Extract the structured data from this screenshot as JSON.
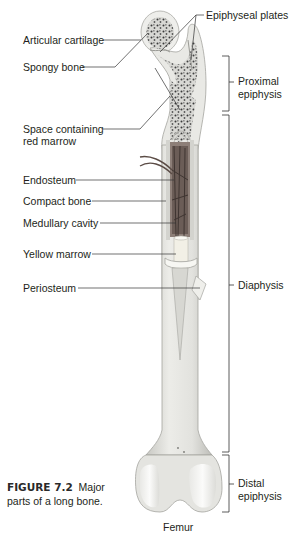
{
  "diagram": {
    "title": "Femur",
    "caption": {
      "figure_number": "FIGURE 7.2",
      "text_line1": "Major",
      "text_line2": "parts of a long bone."
    },
    "left_labels": [
      {
        "id": "articular-cartilage",
        "text": "Articular cartilage"
      },
      {
        "id": "spongy-bone",
        "text": "Spongy bone"
      },
      {
        "id": "space-red-marrow",
        "line1": "Space containing",
        "line2": "red marrow"
      },
      {
        "id": "endosteum",
        "text": "Endosteum"
      },
      {
        "id": "compact-bone",
        "text": "Compact bone"
      },
      {
        "id": "medullary-cavity",
        "text": "Medullary cavity"
      },
      {
        "id": "yellow-marrow",
        "text": "Yellow marrow"
      },
      {
        "id": "periosteum",
        "text": "Periosteum"
      }
    ],
    "top_label": {
      "id": "epiphyseal-plates",
      "text": "Epiphyseal plates"
    },
    "regions": [
      {
        "id": "proximal-epiphysis",
        "line1": "Proximal",
        "line2": "epiphysis"
      },
      {
        "id": "diaphysis",
        "line1": "Diaphysis"
      },
      {
        "id": "distal-epiphysis",
        "line1": "Distal",
        "line2": "epiphysis"
      }
    ],
    "colors": {
      "bone": "#e6e6e2",
      "bone_shade": "#c9c9c4",
      "cartilage": "#f4f4f2",
      "spongy_dots": "#3a3a3a",
      "red_marrow_vessels": "#5a4a44",
      "leader_lines": "#333333"
    }
  }
}
